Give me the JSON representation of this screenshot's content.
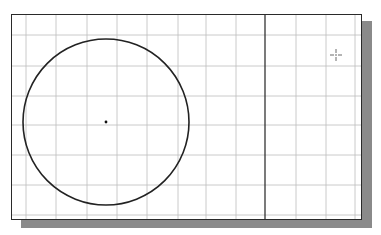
{
  "drawing": {
    "title": "",
    "grid": {
      "color": "#bdbdbd",
      "vertical_lines_x": [
        26,
        56,
        87,
        117,
        147,
        178,
        206,
        236,
        296,
        326,
        355
      ],
      "horizontal_lines_y": [
        35,
        66,
        96,
        125,
        155,
        185,
        215
      ]
    },
    "circle": {
      "cx": 106,
      "cy": 122,
      "r": 83,
      "stroke": "#222222"
    },
    "center_point": {
      "x": 106,
      "y": 122
    },
    "vertical_line": {
      "x": 265,
      "stroke": "#222222"
    },
    "cursor": {
      "type": "crosshair",
      "x": 336,
      "y": 55
    },
    "border_color": "#2a2a2a",
    "shadow_color": "#8a8a8a"
  }
}
